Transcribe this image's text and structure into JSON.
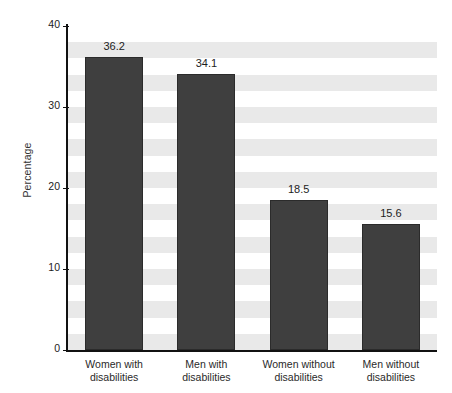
{
  "chart_data": {
    "type": "bar",
    "title": "",
    "subtitle": "",
    "xlabel": "",
    "ylabel": "Percentage",
    "ylim": [
      0,
      40
    ],
    "yticks": [
      0,
      10,
      20,
      30,
      40
    ],
    "ytick_labels": [
      "0",
      "10",
      "20",
      "30",
      "40"
    ],
    "grid": "horizontal-alternating-bands",
    "legend": "none",
    "categories": [
      "Women with disabilities",
      "Men with disabilities",
      "Women without disabilities",
      "Men without disabilities"
    ],
    "category_lines": [
      [
        "Women with",
        "disabilities"
      ],
      [
        "Men with",
        "disabilities"
      ],
      [
        "Women without",
        "disabilities"
      ],
      [
        "Men without",
        "disabilities"
      ]
    ],
    "values": [
      36.2,
      34.1,
      18.5,
      15.6
    ],
    "value_labels": [
      "36.2",
      "34.1",
      "18.5",
      "15.6"
    ],
    "colors": {
      "bar_fill": "#3f3f3f",
      "bar_edge": "#2b2b2b",
      "band": "#e9e9e9",
      "plot_background": "#ffffff",
      "axis": "#111111",
      "text": "#1d1d1d"
    }
  }
}
